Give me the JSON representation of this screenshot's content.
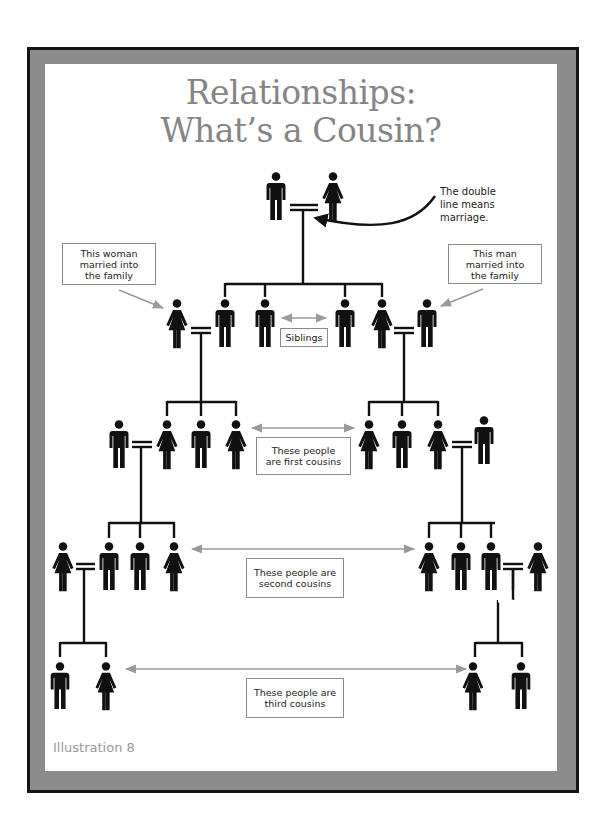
{
  "title": {
    "line1": "Relationships:",
    "line2": "What’s a Cousin?"
  },
  "caption": "Illustration 8",
  "annotations": {
    "double_line_note": "The double\nline means\nmarriage.",
    "woman_married_in": "This woman\nmarried into\nthe family",
    "man_married_in": "This man\nmarried into\nthe family",
    "siblings": "Siblings",
    "first_cousins": "These people\nare first cousins",
    "second_cousins": "These people are\nsecond cousins",
    "third_cousins": "These people are\nthird cousins"
  },
  "colors": {
    "figure": "#111111",
    "arrow_gray": "#9a9a9a",
    "title_gray": "#858585",
    "frame_gray": "#8c8c8c"
  },
  "tree": {
    "generation_1": [
      "man",
      "woman"
    ],
    "generation_2": [
      "woman (married in)",
      "man",
      "man",
      "man",
      "woman",
      "man (married in)"
    ],
    "generation_3": {
      "left": [
        "man (married in)",
        "woman",
        "man",
        "woman"
      ],
      "right": [
        "woman",
        "man",
        "woman",
        "man (married in)"
      ]
    },
    "generation_4": {
      "left": [
        "woman (married in)",
        "man",
        "man",
        "woman"
      ],
      "right": [
        "woman",
        "man",
        "man",
        "woman (married in)"
      ]
    },
    "generation_5": {
      "left": [
        "man",
        "woman"
      ],
      "right": [
        "woman",
        "man"
      ]
    }
  }
}
